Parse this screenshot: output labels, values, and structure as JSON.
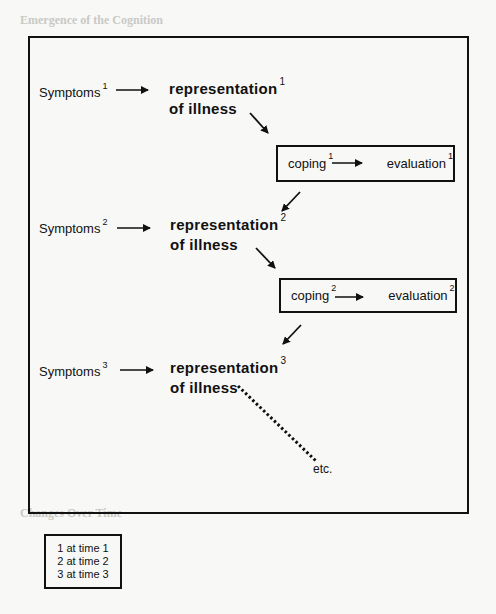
{
  "background_page": {
    "heading_top": "Emergence of the Cognition",
    "heading_bottom": "Changes Over Time"
  },
  "diagram": {
    "rows": [
      {
        "symptoms": {
          "label": "Symptoms",
          "index": "1"
        },
        "representation": {
          "line1": "representation",
          "line2": "of illness",
          "index": "1"
        },
        "coping": {
          "label": "coping",
          "index": "1"
        },
        "evaluation": {
          "label": "evaluation",
          "index": "1"
        }
      },
      {
        "symptoms": {
          "label": "Symptoms",
          "index": "2"
        },
        "representation": {
          "line1": "representation",
          "line2": "of illness",
          "index": "2"
        },
        "coping": {
          "label": "coping",
          "index": "2"
        },
        "evaluation": {
          "label": "evaluation",
          "index": "2"
        }
      },
      {
        "symptoms": {
          "label": "Symptoms",
          "index": "3"
        },
        "representation": {
          "line1": "representation",
          "line2": "of illness",
          "index": "3"
        }
      }
    ],
    "continuation": "etc."
  },
  "legend": {
    "items": [
      "1 at time 1",
      "2 at time 2",
      "3 at time 3"
    ]
  },
  "colors": {
    "ink": "#111111",
    "paper": "#f8f8f6",
    "bleed_text": "#d9d9d6"
  }
}
